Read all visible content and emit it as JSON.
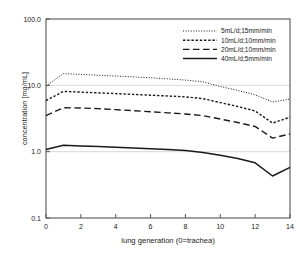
{
  "chart_data": {
    "type": "line",
    "title": "",
    "xlabel": "lung generation (0=trachea)",
    "ylabel": "concentration [mg/mL]",
    "yscale": "log",
    "xlim": [
      0,
      14
    ],
    "ylim": [
      0.1,
      100.0
    ],
    "xticks": [
      0,
      2,
      4,
      6,
      8,
      10,
      12,
      14
    ],
    "xtick_labels": [
      "0",
      "2",
      "4",
      "6",
      "8",
      "10",
      "12",
      "14"
    ],
    "yticks": [
      0.1,
      1.0,
      10.0,
      100.0
    ],
    "ytick_labels": [
      "0.1",
      "1.0",
      "10.0",
      "100.0"
    ],
    "grid": "horizontal-minor",
    "gridlines_at": [
      1.0,
      10.0
    ],
    "legend_position": "top-right",
    "x": [
      0,
      1,
      2,
      3,
      4,
      5,
      6,
      7,
      8,
      9,
      10,
      11,
      12,
      13,
      14
    ],
    "series": [
      {
        "name": "5mL/d;15mm/min",
        "style": "dotted",
        "color": "#1a1a1a",
        "values": [
          9.8,
          15.0,
          14.6,
          14.2,
          13.8,
          13.4,
          13.0,
          12.5,
          12.0,
          11.3,
          9.6,
          8.4,
          7.2,
          5.6,
          6.2
        ]
      },
      {
        "name": "10mL/d;10mm/min",
        "style": "dashed-fine",
        "color": "#1a1a1a",
        "values": [
          5.9,
          8.1,
          7.9,
          7.7,
          7.5,
          7.3,
          7.1,
          6.9,
          6.7,
          6.3,
          5.5,
          4.8,
          4.1,
          2.7,
          3.3
        ]
      },
      {
        "name": "20mL/d;10mm/min",
        "style": "dashed-long",
        "color": "#1a1a1a",
        "values": [
          3.5,
          4.6,
          4.55,
          4.45,
          4.3,
          4.15,
          4.0,
          3.85,
          3.7,
          3.5,
          3.1,
          2.75,
          2.4,
          1.6,
          1.85
        ]
      },
      {
        "name": "40mL/d;5mm/min",
        "style": "solid",
        "color": "#1a1a1a",
        "values": [
          1.08,
          1.25,
          1.22,
          1.2,
          1.17,
          1.14,
          1.11,
          1.08,
          1.04,
          0.97,
          0.88,
          0.79,
          0.68,
          0.43,
          0.58
        ]
      }
    ]
  },
  "axes": {
    "frame_color": "#555555",
    "grid_color": "#cfcfcf"
  }
}
